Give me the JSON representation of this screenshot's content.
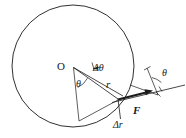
{
  "figure": {
    "kind": "physics-geometry-diagram",
    "background_color": "#ffffff",
    "stroke_color": "#1a1a1a",
    "labels": {
      "center": "O",
      "delta_theta": "Δθ",
      "theta_left": "θ",
      "radius": "r",
      "force": "F",
      "delta_r": "Δr",
      "theta_right": "θ"
    },
    "geometry": {
      "circle": {
        "cx": 73,
        "cy": 66,
        "r": 61
      },
      "center_point": {
        "x": 73,
        "y": 67
      },
      "contact_point": {
        "x": 118,
        "y": 99
      },
      "force_arrow": {
        "x1": 118,
        "y1": 99,
        "x2": 152,
        "y2": 91
      },
      "reference_line": {
        "x1": 113,
        "y1": 102,
        "x2": 184,
        "y2": 85
      },
      "delta_r_segment": {
        "x1": 118,
        "y1": 99,
        "x2": 121,
        "y2": 118
      }
    }
  }
}
